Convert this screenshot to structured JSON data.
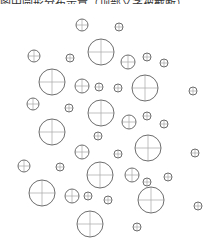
{
  "caption": {
    "text": "图中圆形分布示意（顶部文字被截断）"
  },
  "diagram": {
    "stroke_color": "#6e6e6e",
    "crosshair_color": "#a8a8a8",
    "background": "#ffffff",
    "circles": [
      {
        "cx": 82,
        "cy": 25,
        "r": 6
      },
      {
        "cx": 119,
        "cy": 27,
        "r": 4
      },
      {
        "cx": 34,
        "cy": 56,
        "r": 6
      },
      {
        "cx": 70,
        "cy": 58,
        "r": 4
      },
      {
        "cx": 101,
        "cy": 52,
        "r": 13
      },
      {
        "cx": 128,
        "cy": 62,
        "r": 7
      },
      {
        "cx": 147,
        "cy": 57,
        "r": 4
      },
      {
        "cx": 164,
        "cy": 63,
        "r": 4
      },
      {
        "cx": 52,
        "cy": 82,
        "r": 13
      },
      {
        "cx": 82,
        "cy": 86,
        "r": 7
      },
      {
        "cx": 99,
        "cy": 87,
        "r": 4
      },
      {
        "cx": 118,
        "cy": 88,
        "r": 4
      },
      {
        "cx": 145,
        "cy": 88,
        "r": 13
      },
      {
        "cx": 193,
        "cy": 91,
        "r": 4
      },
      {
        "cx": 33,
        "cy": 104,
        "r": 6
      },
      {
        "cx": 69,
        "cy": 108,
        "r": 4
      },
      {
        "cx": 101,
        "cy": 113,
        "r": 13
      },
      {
        "cx": 129,
        "cy": 122,
        "r": 7
      },
      {
        "cx": 147,
        "cy": 116,
        "r": 4
      },
      {
        "cx": 164,
        "cy": 124,
        "r": 4
      },
      {
        "cx": 52,
        "cy": 132,
        "r": 13
      },
      {
        "cx": 98,
        "cy": 136,
        "r": 4
      },
      {
        "cx": 82,
        "cy": 152,
        "r": 7
      },
      {
        "cx": 118,
        "cy": 154,
        "r": 4
      },
      {
        "cx": 148,
        "cy": 148,
        "r": 13
      },
      {
        "cx": 195,
        "cy": 153,
        "r": 4
      },
      {
        "cx": 24,
        "cy": 166,
        "r": 6
      },
      {
        "cx": 60,
        "cy": 167,
        "r": 4
      },
      {
        "cx": 100,
        "cy": 175,
        "r": 13
      },
      {
        "cx": 132,
        "cy": 175,
        "r": 7
      },
      {
        "cx": 147,
        "cy": 182,
        "r": 4
      },
      {
        "cx": 168,
        "cy": 177,
        "r": 4
      },
      {
        "cx": 42,
        "cy": 193,
        "r": 13
      },
      {
        "cx": 72,
        "cy": 196,
        "r": 7
      },
      {
        "cx": 88,
        "cy": 196,
        "r": 4
      },
      {
        "cx": 108,
        "cy": 200,
        "r": 4
      },
      {
        "cx": 151,
        "cy": 200,
        "r": 13
      },
      {
        "cx": 198,
        "cy": 206,
        "r": 4
      },
      {
        "cx": 90,
        "cy": 224,
        "r": 13
      },
      {
        "cx": 137,
        "cy": 227,
        "r": 4
      }
    ]
  }
}
